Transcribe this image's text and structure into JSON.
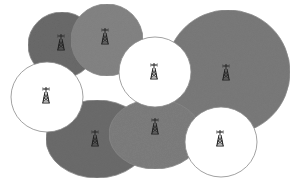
{
  "diagram": {
    "type": "cellular-coverage-illustration",
    "colors": {
      "background": "#ffffff",
      "dark_cell": "#6b6b6b",
      "medium_cell": "#828282",
      "light_cell": "#ffffff",
      "outline": "#8a8a8a",
      "tower": "#222222"
    },
    "cells": [
      {
        "id": "cell-top-left",
        "shape": "ellipse",
        "cx": 62,
        "cy": 45,
        "rx": 34,
        "ry": 33,
        "fill": "#6c6c6c",
        "tower": {
          "x": 61,
          "y": 43
        }
      },
      {
        "id": "cell-top",
        "shape": "ellipse",
        "cx": 107,
        "cy": 40,
        "rx": 36,
        "ry": 36,
        "fill": "#858585",
        "tower": {
          "x": 105,
          "y": 37
        }
      },
      {
        "id": "cell-right-large",
        "shape": "ellipse",
        "cx": 228,
        "cy": 72,
        "rx": 62,
        "ry": 62,
        "fill": "#7b7b7b",
        "tower": {
          "x": 226,
          "y": 73
        }
      },
      {
        "id": "cell-bottom-left",
        "shape": "ellipse",
        "cx": 97,
        "cy": 139,
        "rx": 51,
        "ry": 39,
        "fill": "#6d6d6d",
        "tower": {
          "x": 95,
          "y": 139
        }
      },
      {
        "id": "cell-bottom-center",
        "shape": "ellipse",
        "cx": 155,
        "cy": 134,
        "rx": 46,
        "ry": 35,
        "fill": "#7f7f7f",
        "tower": {
          "x": 155,
          "y": 127
        }
      },
      {
        "id": "cell-left-white",
        "shape": "ellipse",
        "cx": 47,
        "cy": 97,
        "rx": 36,
        "ry": 35,
        "fill": "#ffffff",
        "tower": {
          "x": 46,
          "y": 96
        }
      },
      {
        "id": "cell-center-white",
        "shape": "ellipse",
        "cx": 155,
        "cy": 72,
        "rx": 36,
        "ry": 35,
        "fill": "#ffffff",
        "tower": {
          "x": 154,
          "y": 72
        }
      },
      {
        "id": "cell-bottom-right-white",
        "shape": "ellipse",
        "cx": 221,
        "cy": 142,
        "rx": 36,
        "ry": 35,
        "fill": "#ffffff",
        "tower": {
          "x": 220,
          "y": 139
        }
      }
    ],
    "tower_icon": "cell-tower-icon"
  }
}
